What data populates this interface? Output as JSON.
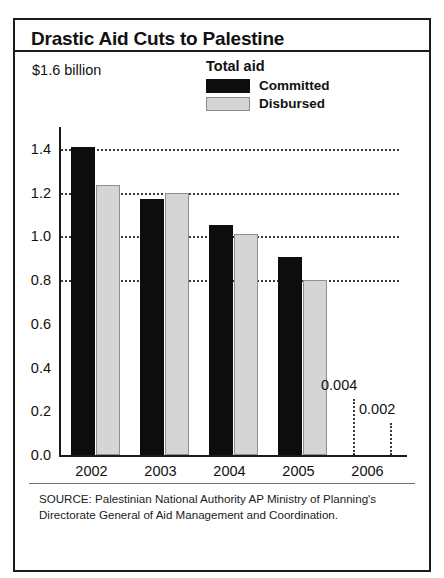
{
  "title": "Drastic Aid Cuts to Palestine",
  "unit_label": "$1.6 billion",
  "legend": {
    "title": "Total aid",
    "items": [
      {
        "label": "Committed",
        "swatch": "black"
      },
      {
        "label": "Disbursed",
        "swatch": "light-gray"
      }
    ]
  },
  "source": "SOURCE: Palestinian National Authority AP Ministry of Planning's Directorate General of Aid Management and Coordination.",
  "chart_data": {
    "type": "bar",
    "title": "Drastic Aid Cuts to Palestine",
    "xlabel": "",
    "ylabel": "$1.6 billion",
    "categories": [
      "2002",
      "2003",
      "2004",
      "2005",
      "2006"
    ],
    "series": [
      {
        "name": "Committed",
        "color": "#0d0d0d",
        "values": [
          1.41,
          1.17,
          1.05,
          0.905,
          0.004
        ]
      },
      {
        "name": "Disbursed",
        "color": "#d5d5d5",
        "values": [
          1.235,
          1.2,
          1.01,
          0.8,
          0.002
        ]
      }
    ],
    "ylim": [
      0.0,
      1.5
    ],
    "yticks": [
      "0.0",
      "0.2",
      "0.4",
      "0.6",
      "0.8",
      "1.0",
      "1.2",
      "1.4"
    ],
    "ytick_values": [
      0.0,
      0.2,
      0.4,
      0.6,
      0.8,
      1.0,
      1.2,
      1.4
    ],
    "gridlines_at": [
      0.8,
      1.0,
      1.2,
      1.4
    ],
    "grid": true,
    "legend_position": "top-center",
    "annotations": [
      {
        "text": "0.004",
        "series": "Committed",
        "category": "2006",
        "value": 0.004
      },
      {
        "text": "0.002",
        "series": "Disbursed",
        "category": "2006",
        "value": 0.002
      }
    ]
  }
}
